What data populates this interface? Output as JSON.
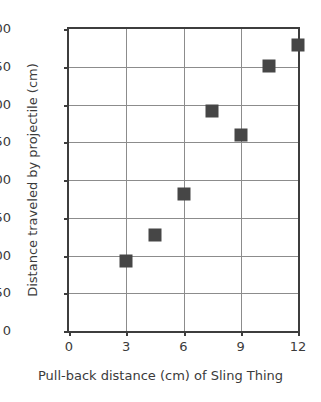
{
  "chart_data": {
    "type": "scatter",
    "title": "",
    "xlabel": "Pull-back distance (cm) of Sling Thing",
    "ylabel": "Distance traveled by projectile (cm)",
    "xlim": [
      0,
      12
    ],
    "ylim": [
      0,
      400
    ],
    "xticks": [
      0,
      3,
      6,
      9,
      12
    ],
    "yticks": [
      0,
      50,
      100,
      150,
      200,
      250,
      300,
      350,
      400
    ],
    "xtick_labels": [
      "0",
      "3",
      "6",
      "9",
      "12"
    ],
    "ytick_labels": [
      "0",
      "50",
      "100",
      "150",
      "200",
      "250",
      "300",
      "350",
      "400"
    ],
    "grid": true,
    "legend": null,
    "marker_color": "#464646",
    "grid_color": "#8c8c8c",
    "axis_color": "#3d3d3d",
    "x": [
      3,
      4.5,
      6,
      7.5,
      9,
      10.5,
      12
    ],
    "y": [
      93,
      127,
      182,
      291,
      259,
      351,
      379
    ],
    "points": [
      {
        "x": 3,
        "y": 93
      },
      {
        "x": 4.5,
        "y": 127
      },
      {
        "x": 6,
        "y": 182
      },
      {
        "x": 7.5,
        "y": 291
      },
      {
        "x": 9,
        "y": 259
      },
      {
        "x": 10.5,
        "y": 351
      },
      {
        "x": 12,
        "y": 379
      }
    ]
  }
}
